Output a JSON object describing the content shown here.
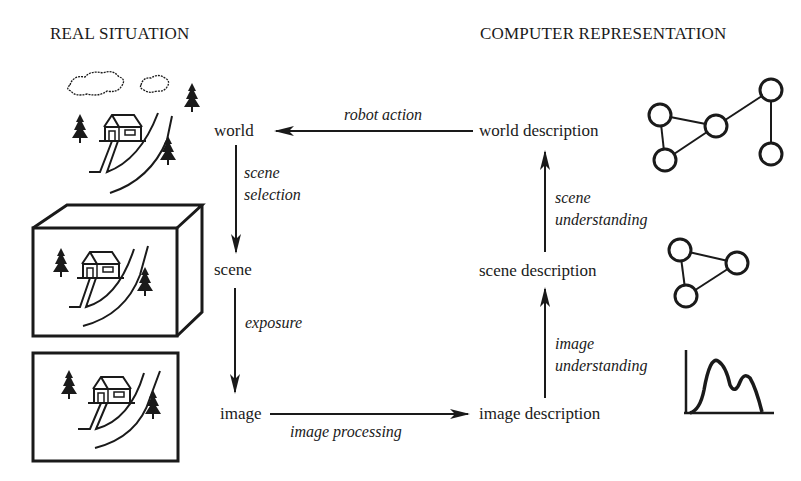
{
  "headings": {
    "left": "REAL SITUATION",
    "right": "COMPUTER REPRESENTATION"
  },
  "nodes": {
    "world": "world",
    "scene": "scene",
    "image": "image",
    "world_description": "world description",
    "scene_description": "scene description",
    "image_description": "image description"
  },
  "edges": {
    "robot_action": "robot action",
    "scene_selection_1": "scene",
    "scene_selection_2": "selection",
    "exposure": "exposure",
    "image_processing": "image processing",
    "image_understanding_1": "image",
    "image_understanding_2": "understanding",
    "scene_understanding_1": "scene",
    "scene_understanding_2": "understanding"
  },
  "illustrations": {
    "left": [
      "world-landscape-icon",
      "scene-box-icon",
      "image-frame-icon"
    ],
    "right": [
      "world-graph-icon",
      "scene-graph-icon",
      "image-histogram-icon"
    ]
  },
  "colors": {
    "ink": "#1a1a1a",
    "background": "#ffffff"
  }
}
